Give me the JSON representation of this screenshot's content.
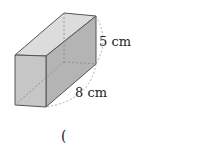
{
  "figure": {
    "type": "rectangular-prism",
    "labels": {
      "height": "5 cm",
      "length": "8 cm"
    },
    "answer_paren": "(",
    "colors": {
      "front": "#c4c4c4",
      "top": "#dcdcdc",
      "side": "#b0b0b0",
      "edge": "#555555",
      "dashed": "#999999"
    }
  }
}
